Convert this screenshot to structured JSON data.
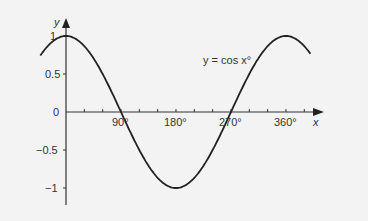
{
  "chart_data": {
    "type": "line",
    "title": "",
    "annotation": "y = cos x°",
    "xlabel": "x",
    "ylabel": "y",
    "x_ticks": [
      "90°",
      "180°",
      "270°",
      "360°"
    ],
    "x_minor_tick_step": 30,
    "y_ticks": [
      "1",
      "0.5",
      "0",
      "−0.5",
      "−1"
    ],
    "xlim": [
      -42,
      400
    ],
    "ylim": [
      -1.2,
      1.05
    ],
    "grid": false,
    "series": [
      {
        "name": "y = cos x°",
        "function": "cos(x degrees)",
        "x": [
          -40,
          0,
          45,
          90,
          135,
          180,
          225,
          270,
          315,
          360,
          400
        ],
        "y": [
          0.77,
          1,
          0.71,
          0,
          -0.71,
          -1,
          -0.71,
          0,
          0.71,
          1,
          0.77
        ]
      }
    ]
  },
  "labels": {
    "x_axis": "x",
    "y_axis": "y",
    "curve": "y = cos x°",
    "y_ticks": [
      "1",
      "0.5",
      "0",
      "−0.5",
      "−1"
    ],
    "x_ticks": [
      "90°",
      "180°",
      "270°",
      "360°"
    ]
  },
  "colors": {
    "background": "#f3f3f3",
    "ink": "#222222"
  }
}
